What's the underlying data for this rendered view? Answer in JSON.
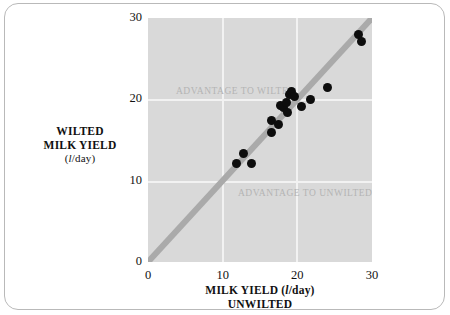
{
  "figure": {
    "background_color": "#ffffff",
    "frame_color": "#b9b9b9",
    "panel_color": "#d9d9d9",
    "gridline_color": "#f2f2f2",
    "point_color": "#0d0d0d",
    "identity_line_color": "#aaaaaa",
    "region_label_color": "#b4b4b4"
  },
  "chart_data": {
    "type": "scatter",
    "title": "",
    "xlabel_line1": "MILK YIELD (l/day)",
    "xlabel_line2": "UNWILTED",
    "ylabel_line1": "WILTED",
    "ylabel_line2": "MILK YIELD",
    "ylabel_line3": "(l/day)",
    "unit_symbol": "l",
    "unit_suffix": "/day",
    "xlim": [
      0,
      30
    ],
    "ylim": [
      0,
      30
    ],
    "xticks": [
      0,
      10,
      20,
      30
    ],
    "yticks": [
      0,
      10,
      20,
      30
    ],
    "xtick_labels": [
      "0",
      "10",
      "20",
      "30"
    ],
    "ytick_labels": [
      "0",
      "10",
      "20",
      "30"
    ],
    "grid": true,
    "legend": "none",
    "reference_line": {
      "name": "identity-line",
      "type": "y=x",
      "from": [
        0,
        0
      ],
      "to": [
        30,
        30
      ],
      "color": "#aaaaaa",
      "width_px": 6
    },
    "annotations": [
      {
        "name": "advantage-to-wilted",
        "text": "ADVANTAGE TO WILTED",
        "x": 11.5,
        "y": 23.0
      },
      {
        "name": "advantage-to-unwilted",
        "text": "ADVANTAGE TO UNWILTED",
        "x": 19.5,
        "y": 12.6
      }
    ],
    "points": [
      {
        "x": 11.8,
        "y": 12.1
      },
      {
        "x": 12.8,
        "y": 13.4
      },
      {
        "x": 13.9,
        "y": 12.1
      },
      {
        "x": 16.5,
        "y": 17.4
      },
      {
        "x": 16.6,
        "y": 15.9
      },
      {
        "x": 17.5,
        "y": 16.9
      },
      {
        "x": 17.7,
        "y": 19.2
      },
      {
        "x": 18.2,
        "y": 19.0
      },
      {
        "x": 18.5,
        "y": 19.6
      },
      {
        "x": 18.7,
        "y": 18.4
      },
      {
        "x": 19.0,
        "y": 20.6
      },
      {
        "x": 19.2,
        "y": 21.0
      },
      {
        "x": 19.6,
        "y": 20.4
      },
      {
        "x": 20.6,
        "y": 19.1
      },
      {
        "x": 21.8,
        "y": 20.0
      },
      {
        "x": 24.1,
        "y": 21.4
      },
      {
        "x": 28.2,
        "y": 28.0
      },
      {
        "x": 28.6,
        "y": 27.1
      }
    ]
  }
}
